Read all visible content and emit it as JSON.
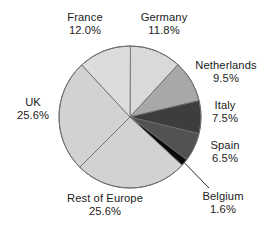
{
  "chart_data": {
    "type": "pie",
    "title": "",
    "subtitle": "",
    "xlabel": "",
    "ylabel": "",
    "legend_position": "none",
    "grid": false,
    "labels_show_percent": true,
    "start_angle_deg": -90,
    "direction": "clockwise",
    "categories": [
      "Germany",
      "Netherlands",
      "Italy",
      "Spain",
      "Belgium",
      "Rest of Europe",
      "UK",
      "France"
    ],
    "values": [
      11.8,
      9.5,
      7.5,
      6.5,
      1.6,
      25.6,
      25.6,
      12.0
    ],
    "units": "percent",
    "slices": [
      {
        "name": "Germany",
        "value": 11.8,
        "label": "Germany",
        "percent_text": "11.8%",
        "color": "#d9d9d9",
        "start_deg": -90.0,
        "sweep_deg": 42.48
      },
      {
        "name": "Netherlands",
        "value": 9.5,
        "label": "Netherlands",
        "percent_text": "9.5%",
        "color": "#a8a8a8",
        "start_deg": -47.52,
        "sweep_deg": 34.2
      },
      {
        "name": "Italy",
        "value": 7.5,
        "label": "Italy",
        "percent_text": "7.5%",
        "color": "#3d3d3d",
        "start_deg": -13.32,
        "sweep_deg": 27.0
      },
      {
        "name": "Spain",
        "value": 6.5,
        "label": "Spain",
        "percent_text": "6.5%",
        "color": "#525252",
        "start_deg": 13.68,
        "sweep_deg": 23.4
      },
      {
        "name": "Belgium",
        "value": 1.6,
        "label": "Belgium",
        "percent_text": "1.6%",
        "color": "#0a0a0a",
        "start_deg": 37.08,
        "sweep_deg": 5.76
      },
      {
        "name": "Rest of Europe",
        "value": 25.6,
        "label": "Rest of Europe",
        "percent_text": "25.6%",
        "color": "#d2d2d2",
        "start_deg": 42.84,
        "sweep_deg": 92.16
      },
      {
        "name": "UK",
        "value": 25.6,
        "label": "UK",
        "percent_text": "25.6%",
        "color": "#d2d2d2",
        "start_deg": 135.0,
        "sweep_deg": 92.16
      },
      {
        "name": "France",
        "value": 12.0,
        "label": "France",
        "percent_text": "12.0%",
        "color": "#dcdcdc",
        "start_deg": 227.16,
        "sweep_deg": 43.2
      }
    ],
    "geometry": {
      "cx": 130,
      "cy": 117,
      "r": 71
    },
    "colors": {
      "background": "#ffffff",
      "outline": "#6e6e6e",
      "text": "#1b1b1b",
      "leader_line": "#2b2b2b"
    }
  },
  "labels": {
    "france": {
      "name": "France",
      "pct": "12.0%"
    },
    "germany": {
      "name": "Germany",
      "pct": "11.8%"
    },
    "netherlands": {
      "name": "Netherlands",
      "pct": "9.5%"
    },
    "italy": {
      "name": "Italy",
      "pct": "7.5%"
    },
    "spain": {
      "name": "Spain",
      "pct": "6.5%"
    },
    "belgium": {
      "name": "Belgium",
      "pct": "1.6%"
    },
    "uk": {
      "name": "UK",
      "pct": "25.6%"
    },
    "rest": {
      "name": "Rest of Europe",
      "pct": "25.6%"
    }
  }
}
